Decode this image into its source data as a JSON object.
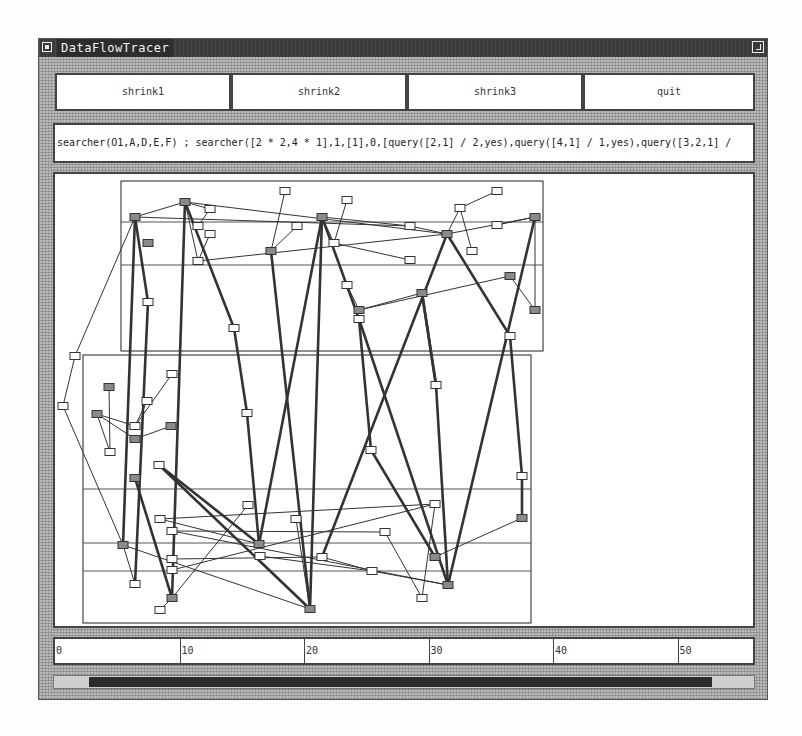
{
  "window": {
    "title": "DataFlowTracer",
    "menu_icon": "window-menu-icon",
    "maximize_icon": "window-maximize-icon"
  },
  "toolbar": {
    "buttons": [
      {
        "label": "shrink1"
      },
      {
        "label": "shrink2"
      },
      {
        "label": "shrink3"
      },
      {
        "label": "quit"
      }
    ]
  },
  "command_line": {
    "text": "searcher(O1,A,D,E,F) ; searcher([2 * 2,4 * 1],1,[1],0,[query([2,1] / 2,yes),query([4,1] / 1,yes),query([3,2,1] /"
  },
  "ruler": {
    "ticks": [
      "0",
      "10",
      "20",
      "30",
      "40",
      "50"
    ]
  },
  "scrollbar": {
    "thumb_start_pct": 5,
    "thumb_end_pct": 94
  },
  "graph": {
    "offset": [
      52,
      171
    ],
    "regions": [
      {
        "x": 118,
        "y": 178,
        "w": 422,
        "h": 170,
        "dividers": [
          219,
          262
        ]
      },
      {
        "x": 80,
        "y": 352,
        "w": 448,
        "h": 268,
        "dividers": [
          486,
          540,
          568
        ]
      }
    ],
    "nodes": [
      {
        "id": "a1",
        "x": 132,
        "y": 214,
        "dark": true
      },
      {
        "id": "a2",
        "x": 182,
        "y": 199,
        "dark": true
      },
      {
        "id": "a3",
        "x": 207,
        "y": 206,
        "dark": false
      },
      {
        "id": "a4",
        "x": 195,
        "y": 223,
        "dark": false
      },
      {
        "id": "a5",
        "x": 207,
        "y": 231,
        "dark": false
      },
      {
        "id": "a6",
        "x": 195,
        "y": 258,
        "dark": false
      },
      {
        "id": "a7",
        "x": 145,
        "y": 240,
        "dark": true
      },
      {
        "id": "a8",
        "x": 282,
        "y": 188,
        "dark": false
      },
      {
        "id": "a9",
        "x": 294,
        "y": 223,
        "dark": false
      },
      {
        "id": "a10",
        "x": 268,
        "y": 248,
        "dark": true
      },
      {
        "id": "a11",
        "x": 319,
        "y": 214,
        "dark": true
      },
      {
        "id": "a12",
        "x": 344,
        "y": 197,
        "dark": false
      },
      {
        "id": "a13",
        "x": 331,
        "y": 240,
        "dark": false
      },
      {
        "id": "a14",
        "x": 407,
        "y": 223,
        "dark": false
      },
      {
        "id": "a15",
        "x": 407,
        "y": 257,
        "dark": false
      },
      {
        "id": "a16",
        "x": 457,
        "y": 205,
        "dark": false
      },
      {
        "id": "a17",
        "x": 494,
        "y": 188,
        "dark": false
      },
      {
        "id": "a18",
        "x": 444,
        "y": 231,
        "dark": true
      },
      {
        "id": "a19",
        "x": 469,
        "y": 248,
        "dark": false
      },
      {
        "id": "a20",
        "x": 494,
        "y": 222,
        "dark": false
      },
      {
        "id": "a21",
        "x": 532,
        "y": 214,
        "dark": true
      },
      {
        "id": "a22",
        "x": 344,
        "y": 282,
        "dark": false
      },
      {
        "id": "a23",
        "x": 356,
        "y": 307,
        "dark": true
      },
      {
        "id": "a24",
        "x": 419,
        "y": 290,
        "dark": true
      },
      {
        "id": "a25",
        "x": 507,
        "y": 273,
        "dark": true
      },
      {
        "id": "a26",
        "x": 532,
        "y": 307,
        "dark": true
      },
      {
        "id": "a27",
        "x": 145,
        "y": 299,
        "dark": false
      },
      {
        "id": "a28",
        "x": 231,
        "y": 325,
        "dark": false
      },
      {
        "id": "a29",
        "x": 356,
        "y": 316,
        "dark": false
      },
      {
        "id": "a30",
        "x": 507,
        "y": 333,
        "dark": false
      },
      {
        "id": "b1",
        "x": 72,
        "y": 353,
        "dark": false
      },
      {
        "id": "b2",
        "x": 60,
        "y": 403,
        "dark": false
      },
      {
        "id": "b3",
        "x": 106,
        "y": 384,
        "dark": true
      },
      {
        "id": "b4",
        "x": 94,
        "y": 411,
        "dark": true
      },
      {
        "id": "b5",
        "x": 144,
        "y": 398,
        "dark": false
      },
      {
        "id": "b6",
        "x": 132,
        "y": 423,
        "dark": false
      },
      {
        "id": "b7",
        "x": 132,
        "y": 436,
        "dark": true
      },
      {
        "id": "b8",
        "x": 168,
        "y": 423,
        "dark": true
      },
      {
        "id": "b9",
        "x": 107,
        "y": 449,
        "dark": false
      },
      {
        "id": "b10",
        "x": 169,
        "y": 371,
        "dark": false
      },
      {
        "id": "b11",
        "x": 156,
        "y": 462,
        "dark": false
      },
      {
        "id": "b12",
        "x": 132,
        "y": 475,
        "dark": true
      },
      {
        "id": "b13",
        "x": 244,
        "y": 410,
        "dark": false
      },
      {
        "id": "b14",
        "x": 433,
        "y": 382,
        "dark": false
      },
      {
        "id": "b15",
        "x": 368,
        "y": 447,
        "dark": false
      },
      {
        "id": "b16",
        "x": 519,
        "y": 473,
        "dark": false
      },
      {
        "id": "c1",
        "x": 157,
        "y": 516,
        "dark": false
      },
      {
        "id": "c2",
        "x": 169,
        "y": 528,
        "dark": false
      },
      {
        "id": "c3",
        "x": 245,
        "y": 502,
        "dark": false
      },
      {
        "id": "c4",
        "x": 120,
        "y": 542,
        "dark": true
      },
      {
        "id": "c5",
        "x": 169,
        "y": 556,
        "dark": false
      },
      {
        "id": "c6",
        "x": 169,
        "y": 567,
        "dark": false
      },
      {
        "id": "c7",
        "x": 256,
        "y": 541,
        "dark": true
      },
      {
        "id": "c8",
        "x": 257,
        "y": 553,
        "dark": false
      },
      {
        "id": "c9",
        "x": 132,
        "y": 581,
        "dark": false
      },
      {
        "id": "c10",
        "x": 169,
        "y": 595,
        "dark": true
      },
      {
        "id": "c11",
        "x": 157,
        "y": 607,
        "dark": false
      },
      {
        "id": "c12",
        "x": 293,
        "y": 516,
        "dark": false
      },
      {
        "id": "c13",
        "x": 307,
        "y": 606,
        "dark": true
      },
      {
        "id": "c14",
        "x": 319,
        "y": 554,
        "dark": false
      },
      {
        "id": "c15",
        "x": 369,
        "y": 568,
        "dark": false
      },
      {
        "id": "c16",
        "x": 382,
        "y": 529,
        "dark": false
      },
      {
        "id": "c17",
        "x": 432,
        "y": 501,
        "dark": false
      },
      {
        "id": "c18",
        "x": 432,
        "y": 554,
        "dark": true
      },
      {
        "id": "c19",
        "x": 419,
        "y": 595,
        "dark": false
      },
      {
        "id": "c20",
        "x": 445,
        "y": 582,
        "dark": true
      },
      {
        "id": "c21",
        "x": 519,
        "y": 515,
        "dark": true
      }
    ],
    "edges": [
      [
        "a1",
        "a2",
        1
      ],
      [
        "a1",
        "a14",
        1
      ],
      [
        "a2",
        "a3",
        1
      ],
      [
        "a2",
        "a6",
        1
      ],
      [
        "a2",
        "a18",
        1
      ],
      [
        "a3",
        "a4",
        1
      ],
      [
        "a5",
        "a6",
        1
      ],
      [
        "a6",
        "a18",
        1
      ],
      [
        "a8",
        "a10",
        1
      ],
      [
        "a10",
        "a9",
        1
      ],
      [
        "a11",
        "a13",
        1
      ],
      [
        "a12",
        "a13",
        1
      ],
      [
        "a11",
        "a14",
        1
      ],
      [
        "a13",
        "a15",
        1
      ],
      [
        "a14",
        "a18",
        1
      ],
      [
        "a16",
        "a17",
        1
      ],
      [
        "a16",
        "a18",
        1
      ],
      [
        "a16",
        "a19",
        1
      ],
      [
        "a18",
        "a21",
        1
      ],
      [
        "a21",
        "a20",
        1
      ],
      [
        "a21",
        "a26",
        1
      ],
      [
        "a22",
        "a23",
        1
      ],
      [
        "a23",
        "a25",
        1
      ],
      [
        "a24",
        "a23",
        1
      ],
      [
        "a25",
        "a26",
        1
      ],
      [
        "b1",
        "b2",
        1
      ],
      [
        "b1",
        "a1",
        1
      ],
      [
        "b2",
        "c4",
        1
      ],
      [
        "b3",
        "b9",
        1
      ],
      [
        "b4",
        "b9",
        1
      ],
      [
        "b4",
        "b6",
        1
      ],
      [
        "b4",
        "b7",
        1
      ],
      [
        "b5",
        "b6",
        1
      ],
      [
        "b6",
        "b10",
        1
      ],
      [
        "b7",
        "b8",
        1
      ],
      [
        "c4",
        "c9",
        1
      ],
      [
        "c4",
        "c13",
        1
      ],
      [
        "c1",
        "c7",
        1
      ],
      [
        "c1",
        "c17",
        1
      ],
      [
        "c2",
        "c16",
        1
      ],
      [
        "c3",
        "c10",
        1
      ],
      [
        "c2",
        "c20",
        1
      ],
      [
        "c8",
        "c15",
        1
      ],
      [
        "c12",
        "c13",
        1
      ],
      [
        "c14",
        "c15",
        1
      ],
      [
        "c15",
        "c20",
        1
      ],
      [
        "c16",
        "c19",
        1
      ],
      [
        "c17",
        "c19",
        1
      ],
      [
        "c18",
        "c21",
        1
      ],
      [
        "c11",
        "c10",
        1
      ],
      [
        "c6",
        "c17",
        1
      ],
      [
        "c5",
        "c14",
        1
      ],
      [
        "a1",
        "a27",
        3
      ],
      [
        "a27",
        "c9",
        3
      ],
      [
        "a1",
        "c4",
        3
      ],
      [
        "a2",
        "c10",
        3
      ],
      [
        "a2",
        "a28",
        3
      ],
      [
        "a28",
        "b13",
        3
      ],
      [
        "b13",
        "c7",
        3
      ],
      [
        "a10",
        "c13",
        3
      ],
      [
        "a11",
        "c7",
        3
      ],
      [
        "a11",
        "a29",
        3
      ],
      [
        "a29",
        "b15",
        3
      ],
      [
        "b15",
        "c18",
        3
      ],
      [
        "a11",
        "c13",
        3
      ],
      [
        "a18",
        "c14",
        3
      ],
      [
        "a18",
        "a30",
        3
      ],
      [
        "a30",
        "b16",
        3
      ],
      [
        "b16",
        "c21",
        3
      ],
      [
        "a21",
        "c20",
        3
      ],
      [
        "a24",
        "b14",
        3
      ],
      [
        "b14",
        "c20",
        3
      ],
      [
        "b11",
        "c13",
        3
      ],
      [
        "b11",
        "c7",
        3
      ],
      [
        "b12",
        "c10",
        3
      ],
      [
        "a29",
        "c20",
        3
      ],
      [
        "a24",
        "b14",
        3
      ]
    ]
  }
}
